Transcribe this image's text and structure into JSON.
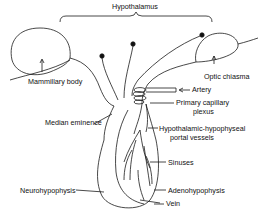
{
  "figure": {
    "title": "Hypothalamus",
    "labels": {
      "hypothalamus": "Hypothalamus",
      "mammillary_body": "Mammillary body",
      "optic_chiasma": "Optic chiasma",
      "artery": "Artery",
      "primary_capillary_1": "Primary capillary",
      "primary_capillary_2": "plexus",
      "median_eminence": "Median eminence",
      "portal_1": "Hypothalamic-hypophyseal",
      "portal_2": "portal vessels",
      "sinuses": "Sinuses",
      "neurohypophysis": "Neurohypophysis",
      "adenohypophysis": "Adenohypophysis",
      "vein": "Vein"
    },
    "colors": {
      "line": "#1a1a1a",
      "background": "#ffffff",
      "shade": "#ececec"
    }
  }
}
